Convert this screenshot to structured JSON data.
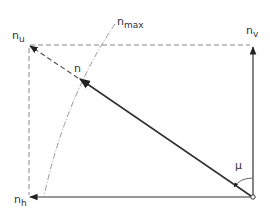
{
  "diagram": {
    "type": "vector decomposition",
    "colors": {
      "solid_line": "#333333",
      "dashed_line": "#888888",
      "arc_line": "#999999",
      "background": "#ffffff"
    },
    "labels": {
      "n_u": {
        "base": "n",
        "sub": "u"
      },
      "n_v": {
        "base": "n",
        "sub": "v"
      },
      "n_h": {
        "base": "n",
        "sub": "h"
      },
      "n": {
        "base": "n"
      },
      "n_max": {
        "base": "n",
        "sub": "max"
      },
      "mu": {
        "base": "μ"
      }
    },
    "vectors": [
      {
        "name": "n",
        "from": "origin",
        "to": "n_u",
        "style": "solid"
      },
      {
        "name": "n_v",
        "from": "origin",
        "to": "n_v",
        "style": "solid"
      },
      {
        "name": "n_h",
        "from": "origin",
        "to": "n_h",
        "style": "solid"
      }
    ],
    "angle": {
      "symbol": "μ",
      "between": [
        "n_v",
        "n"
      ]
    }
  }
}
